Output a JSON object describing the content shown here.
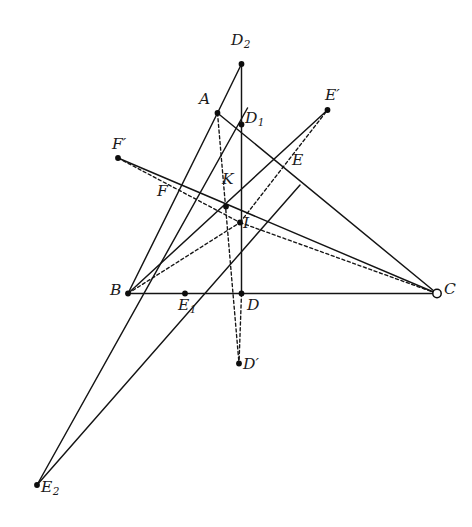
{
  "figure": {
    "width": 472,
    "height": 527,
    "background": "#ffffff",
    "stroke_color": "#141414",
    "label_color": "#1b1b1b"
  },
  "points": [
    {
      "id": "D2",
      "label": "D",
      "sub": "2",
      "prime": "",
      "x": 241.5,
      "y": 64.0,
      "marker": "dot",
      "label_x": 231.0,
      "label_y": 33.0
    },
    {
      "id": "A",
      "label": "A",
      "sub": "",
      "prime": "",
      "x": 217.5,
      "y": 113.0,
      "marker": "dot",
      "label_x": 199.0,
      "label_y": 92.0
    },
    {
      "id": "Ep",
      "label": "E",
      "sub": "",
      "prime": "′",
      "x": 327.5,
      "y": 110.0,
      "marker": "dot",
      "label_x": 325.0,
      "label_y": 88.0
    },
    {
      "id": "D1",
      "label": "D",
      "sub": "1",
      "prime": "",
      "x": 241.5,
      "y": 124.5,
      "marker": "dot",
      "label_x": 245.0,
      "label_y": 111.0
    },
    {
      "id": "Fp",
      "label": "F",
      "sub": "",
      "prime": "′",
      "x": 118.0,
      "y": 158.0,
      "marker": "dot",
      "label_x": 112.0,
      "label_y": 137.0
    },
    {
      "id": "E",
      "label": "E",
      "sub": "",
      "prime": "",
      "x": 284.5,
      "y": 164.5,
      "marker": "none",
      "label_x": 292.0,
      "label_y": 153.0
    },
    {
      "id": "F",
      "label": "F",
      "sub": "",
      "prime": "",
      "x": 180.5,
      "y": 190.5,
      "marker": "none",
      "label_x": 157.0,
      "label_y": 184.0
    },
    {
      "id": "K",
      "label": "K",
      "sub": "",
      "prime": "",
      "x": 226.0,
      "y": 206.5,
      "marker": "dot",
      "label_x": 222.0,
      "label_y": 172.0
    },
    {
      "id": "I",
      "label": "I",
      "sub": "",
      "prime": "",
      "x": 240.0,
      "y": 222.5,
      "marker": "dot",
      "label_x": 243.0,
      "label_y": 216.0
    },
    {
      "id": "B",
      "label": "B",
      "sub": "",
      "prime": "",
      "x": 128.0,
      "y": 293.5,
      "marker": "dot",
      "label_x": 110.0,
      "label_y": 283.0
    },
    {
      "id": "E1",
      "label": "E",
      "sub": "1",
      "prime": "",
      "x": 185.0,
      "y": 293.5,
      "marker": "dot",
      "label_x": 178.0,
      "label_y": 298.0
    },
    {
      "id": "D",
      "label": "D",
      "sub": "",
      "prime": "",
      "x": 241.5,
      "y": 293.5,
      "marker": "dot",
      "label_x": 247.0,
      "label_y": 298.0
    },
    {
      "id": "C",
      "label": "C",
      "sub": "",
      "prime": "",
      "x": 437.0,
      "y": 293.5,
      "marker": "ring",
      "label_x": 444.0,
      "label_y": 282.0
    },
    {
      "id": "Dp",
      "label": "D",
      "sub": "",
      "prime": "′",
      "x": 239.0,
      "y": 363.5,
      "marker": "dot",
      "label_x": 243.0,
      "label_y": 357.0
    },
    {
      "id": "E2",
      "label": "E",
      "sub": "2",
      "prime": "",
      "x": 37.0,
      "y": 485.0,
      "marker": "dot",
      "label_x": 41.0,
      "label_y": 480.0
    }
  ],
  "segments": [
    {
      "name": "side-BC",
      "from": "B",
      "to": "C",
      "style": "solid"
    },
    {
      "name": "side-AB-extended",
      "from": "A",
      "to": "B",
      "style": "solid"
    },
    {
      "name": "side-AC-through-E",
      "from": "A",
      "to": "C",
      "style": "solid"
    },
    {
      "name": "cevian-A-to-D2",
      "from": "A",
      "to": "D2",
      "style": "solid"
    },
    {
      "name": "altitude-D2-to-D",
      "from": "D2",
      "to": "D",
      "style": "solid"
    },
    {
      "name": "cevian-A-to-Dprime",
      "from": "A",
      "to": "Dp",
      "style": "dashed"
    },
    {
      "name": "segment-D-to-Dprime",
      "from": "D",
      "to": "Dp",
      "style": "dashed"
    },
    {
      "name": "cevian-B-to-Eprime",
      "from": "B",
      "to": "Ep",
      "style": "solid"
    },
    {
      "name": "cevian-I-to-Eprime",
      "from": "E2",
      "to": "Ep",
      "style": "dashed"
    },
    {
      "name": "cevian-C-to-Fprime",
      "from": "C",
      "to": "Fp",
      "style": "solid"
    },
    {
      "name": "cevian-I-to-C",
      "from": "I",
      "to": "C",
      "style": "dashed"
    },
    {
      "name": "cevian-B-to-I-C",
      "from": "B",
      "to": "Ep",
      "style": "dashed"
    },
    {
      "name": "line-E2-through-B",
      "from": "E2",
      "to": "D1",
      "style": "solid"
    },
    {
      "name": "line-E2-through-E1",
      "from": "E2",
      "to": "E",
      "style": "solid"
    },
    {
      "name": "chord-Fprime-to-I",
      "from": "Fp",
      "to": "C",
      "style": "dashed"
    }
  ],
  "labels": {
    "D2": "D₂",
    "A": "A",
    "Eprime": "E′",
    "D1": "D₁",
    "Fprime": "F′",
    "E": "E",
    "F": "F",
    "K": "K",
    "I": "I",
    "B": "B",
    "E1": "E₁",
    "D": "D",
    "C": "C",
    "Dprime": "D′",
    "E2": "E₂"
  }
}
